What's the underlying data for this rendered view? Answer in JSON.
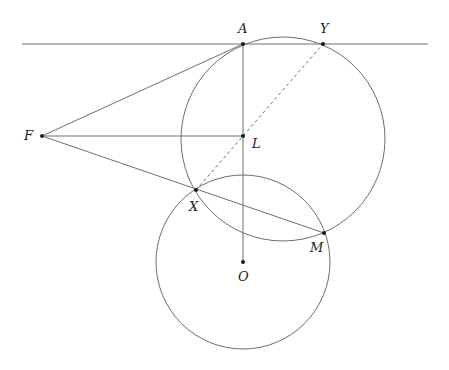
{
  "diagram": {
    "type": "geometry",
    "stroke_color": "#6e6e6e",
    "point_color": "#1a1a1a",
    "tangent_line": {
      "x1": 22,
      "y1": 44,
      "x2": 428,
      "y2": 44
    },
    "circles": [
      {
        "name": "upper-circle",
        "cx": 283,
        "cy": 139,
        "r": 102
      },
      {
        "name": "lower-circle",
        "cx": 243,
        "cy": 262,
        "r": 87
      }
    ],
    "points": {
      "A": {
        "x": 243,
        "y": 44,
        "label": "A",
        "lx": 238,
        "ly": 22
      },
      "Y": {
        "x": 323,
        "y": 44,
        "label": "Y",
        "lx": 320,
        "ly": 22
      },
      "F": {
        "x": 42,
        "y": 136,
        "label": "F",
        "lx": 24,
        "ly": 129
      },
      "L": {
        "x": 243,
        "y": 136,
        "label": "L",
        "lx": 252,
        "ly": 137
      },
      "X": {
        "x": 196,
        "y": 190,
        "label": "X",
        "lx": 189,
        "ly": 200
      },
      "M": {
        "x": 324,
        "y": 233,
        "label": "M",
        "lx": 310,
        "ly": 241
      },
      "O": {
        "x": 243,
        "y": 262,
        "label": "O",
        "lx": 238,
        "ly": 270
      }
    },
    "segments": [
      [
        "F",
        "A"
      ],
      [
        "F",
        "L"
      ],
      [
        "F",
        "M"
      ],
      [
        "A",
        "O"
      ]
    ],
    "dashed_segments": [
      [
        "X",
        "Y"
      ]
    ]
  }
}
